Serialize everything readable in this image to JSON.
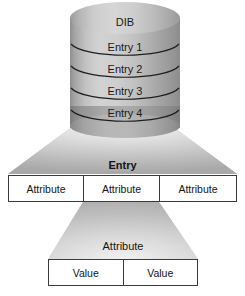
{
  "diagram": {
    "background_color": "#ffffff",
    "ink_color": "#3b3b3b",
    "fill_color": "#c9c9c9"
  },
  "cylinder": {
    "name": "dib-cylinder",
    "label": "DIB",
    "entries": [
      {
        "label": "Entry 1"
      },
      {
        "label": "Entry 2"
      },
      {
        "label": "Entry 3"
      },
      {
        "label": "Entry 4"
      }
    ]
  },
  "entry_level": {
    "caption": "Entry",
    "cells": [
      {
        "label": "Attribute"
      },
      {
        "label": "Attribute"
      },
      {
        "label": "Attribute"
      }
    ]
  },
  "attribute_level": {
    "caption": "Attribute",
    "cells": [
      {
        "label": "Value"
      },
      {
        "label": "Value"
      }
    ]
  }
}
